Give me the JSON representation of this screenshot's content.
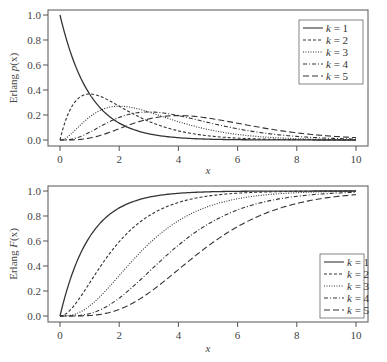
{
  "figure": {
    "panels": [
      {
        "id": "pdf",
        "ylabel_prefix": "Erlang ",
        "ylabel_func": "p",
        "ylabel_arg": "(x)",
        "xlabel": "x",
        "xticks": [
          "0",
          "2",
          "4",
          "6",
          "8",
          "10"
        ],
        "yticks": [
          "0.0",
          "0.2",
          "0.4",
          "0.6",
          "0.8",
          "1.0"
        ]
      },
      {
        "id": "cdf",
        "ylabel_prefix": "Erlang ",
        "ylabel_func": "F",
        "ylabel_arg": "(x)",
        "xlabel": "x",
        "xticks": [
          "0",
          "2",
          "4",
          "6",
          "8",
          "10"
        ],
        "yticks": [
          "0.0",
          "0.2",
          "0.4",
          "0.6",
          "0.8",
          "1.0"
        ]
      }
    ],
    "legend": [
      {
        "label": "k = 1",
        "k": "k",
        "eq": " = 1",
        "dash": ""
      },
      {
        "label": "k = 2",
        "k": "k",
        "eq": " = 2",
        "dash": "3,2"
      },
      {
        "label": "k = 3",
        "k": "k",
        "eq": " = 3",
        "dash": "1,1.5"
      },
      {
        "label": "k = 4",
        "k": "k",
        "eq": " = 4",
        "dash": "4,2,1,2"
      },
      {
        "label": "k = 5",
        "k": "k",
        "eq": " = 5",
        "dash": "6,3"
      }
    ]
  },
  "chart_data": [
    {
      "type": "line",
      "title": "",
      "xlabel": "x",
      "ylabel": "Erlang p(x)",
      "xlim": [
        0,
        10
      ],
      "ylim": [
        0,
        1.0
      ],
      "grid": false,
      "legend_position": "upper right",
      "rate": 1,
      "x": [
        0,
        1,
        2,
        3,
        4,
        5,
        6,
        7,
        8,
        9,
        10
      ],
      "series": [
        {
          "name": "k = 1",
          "values": [
            1.0,
            0.368,
            0.135,
            0.05,
            0.018,
            0.007,
            0.002,
            0.001,
            0.0,
            0.0,
            0.0
          ]
        },
        {
          "name": "k = 2",
          "values": [
            0.0,
            0.368,
            0.271,
            0.149,
            0.073,
            0.034,
            0.015,
            0.006,
            0.003,
            0.001,
            0.0
          ]
        },
        {
          "name": "k = 3",
          "values": [
            0.0,
            0.184,
            0.271,
            0.224,
            0.147,
            0.084,
            0.045,
            0.022,
            0.011,
            0.005,
            0.002
          ]
        },
        {
          "name": "k = 4",
          "values": [
            0.0,
            0.061,
            0.18,
            0.224,
            0.195,
            0.14,
            0.089,
            0.052,
            0.029,
            0.015,
            0.008
          ]
        },
        {
          "name": "k = 5",
          "values": [
            0.0,
            0.015,
            0.09,
            0.168,
            0.195,
            0.175,
            0.134,
            0.091,
            0.057,
            0.034,
            0.019
          ]
        }
      ]
    },
    {
      "type": "line",
      "title": "",
      "xlabel": "x",
      "ylabel": "Erlang F(x)",
      "xlim": [
        0,
        10
      ],
      "ylim": [
        0,
        1.0
      ],
      "grid": false,
      "legend_position": "lower right",
      "rate": 1,
      "x": [
        0,
        1,
        2,
        3,
        4,
        5,
        6,
        7,
        8,
        9,
        10
      ],
      "series": [
        {
          "name": "k = 1",
          "values": [
            0.0,
            0.632,
            0.865,
            0.95,
            0.982,
            0.993,
            0.998,
            0.999,
            1.0,
            1.0,
            1.0
          ]
        },
        {
          "name": "k = 2",
          "values": [
            0.0,
            0.264,
            0.594,
            0.801,
            0.908,
            0.96,
            0.983,
            0.993,
            0.997,
            0.999,
            1.0
          ]
        },
        {
          "name": "k = 3",
          "values": [
            0.0,
            0.08,
            0.323,
            0.577,
            0.762,
            0.875,
            0.938,
            0.97,
            0.986,
            0.994,
            0.997
          ]
        },
        {
          "name": "k = 4",
          "values": [
            0.0,
            0.019,
            0.143,
            0.353,
            0.567,
            0.735,
            0.849,
            0.918,
            0.958,
            0.979,
            0.99
          ]
        },
        {
          "name": "k = 5",
          "values": [
            0.0,
            0.004,
            0.053,
            0.185,
            0.371,
            0.56,
            0.715,
            0.827,
            0.9,
            0.945,
            0.971
          ]
        }
      ]
    }
  ]
}
